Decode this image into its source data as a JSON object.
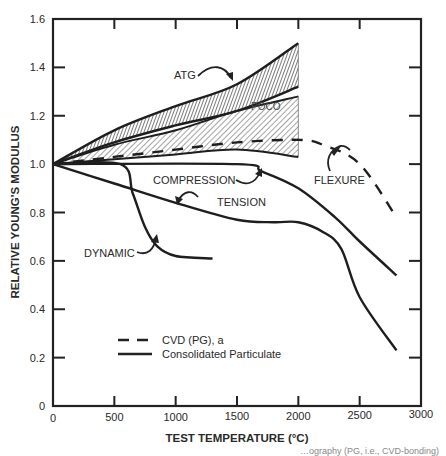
{
  "chart_data": {
    "type": "line",
    "title": "",
    "xlabel": "TEST TEMPERATURE (°C)",
    "ylabel": "RELATIVE YOUNG'S MODULUS",
    "xlim": [
      0,
      3000
    ],
    "ylim": [
      0,
      1.6
    ],
    "x_ticks": [
      0,
      500,
      1000,
      1500,
      2000,
      2500,
      3000
    ],
    "x_tick_labels": [
      "0",
      "500",
      "1000",
      "1500",
      "2000",
      "2500",
      "3000"
    ],
    "y_ticks": [
      0,
      0.2,
      0.4,
      0.6,
      0.8,
      1.0,
      1.2,
      1.4,
      1.6
    ],
    "y_tick_labels": [
      "0",
      "0.2",
      "0.4",
      "0.6",
      "0.8",
      "1.0",
      "1.2",
      "1.4",
      "1.6"
    ],
    "grid": false,
    "legend": {
      "position": "lower-left",
      "entries": [
        {
          "label": "CVD (PG), a",
          "style": "dashed"
        },
        {
          "label": "Consolidated Particulate",
          "style": "solid"
        }
      ]
    },
    "bands": [
      {
        "name": "ATG",
        "hatch": "vertical-dense",
        "upper": {
          "x": [
            0,
            500,
            1000,
            1500,
            2000
          ],
          "y": [
            1.0,
            1.14,
            1.24,
            1.33,
            1.5
          ]
        },
        "lower": {
          "x": [
            0,
            500,
            1000,
            1500,
            2000
          ],
          "y": [
            1.0,
            1.09,
            1.16,
            1.22,
            1.32
          ]
        }
      },
      {
        "name": "POCO",
        "hatch": "diagonal",
        "upper": {
          "x": [
            0,
            500,
            1000,
            1500,
            2000
          ],
          "y": [
            1.0,
            1.08,
            1.14,
            1.22,
            1.28
          ]
        },
        "lower": {
          "x": [
            0,
            500,
            1000,
            1500,
            2000
          ],
          "y": [
            1.0,
            1.02,
            1.04,
            1.06,
            1.03
          ]
        }
      }
    ],
    "series": [
      {
        "name": "FLEXURE (CVD)",
        "style": "dashed",
        "x": [
          0,
          500,
          1000,
          1500,
          2000,
          2200,
          2500,
          2800
        ],
        "y": [
          1.0,
          1.03,
          1.06,
          1.09,
          1.1,
          1.08,
          1.0,
          0.78
        ]
      },
      {
        "name": "COMPRESSION",
        "style": "solid",
        "x": [
          0,
          1500,
          1700,
          2000,
          2300,
          2500,
          2800
        ],
        "y": [
          1.0,
          1.0,
          0.97,
          0.9,
          0.78,
          0.68,
          0.54
        ]
      },
      {
        "name": "TENSION",
        "style": "solid",
        "x": [
          0,
          500,
          1000,
          1500,
          1800,
          2000,
          2200,
          2350,
          2500,
          2800
        ],
        "y": [
          1.0,
          0.92,
          0.84,
          0.77,
          0.76,
          0.76,
          0.72,
          0.65,
          0.45,
          0.23
        ]
      },
      {
        "name": "DYNAMIC",
        "style": "solid",
        "x": [
          0,
          550,
          650,
          750,
          850,
          1000,
          1300
        ],
        "y": [
          1.0,
          1.0,
          0.88,
          0.74,
          0.66,
          0.62,
          0.61
        ]
      }
    ],
    "annotations": [
      {
        "text": "ATG",
        "x": 700,
        "y": 1.27
      },
      {
        "text": "POCO",
        "x": 1500,
        "y": 1.2
      },
      {
        "text": "FLEXURE",
        "x": 2200,
        "y": 0.98
      },
      {
        "text": "COMPRESSION",
        "x": 800,
        "y": 0.93
      },
      {
        "text": "TENSION",
        "x": 1100,
        "y": 0.84
      },
      {
        "text": "DYNAMIC",
        "x": 200,
        "y": 0.61
      }
    ]
  },
  "caption_fragment": "…ography (PG, i.e., CVD-bonding)"
}
